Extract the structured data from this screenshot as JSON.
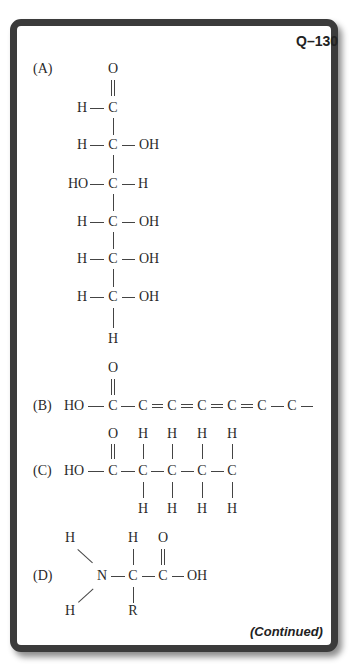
{
  "header": {
    "question_id": "Q–130"
  },
  "footer": {
    "continued_label": "(Continued)"
  },
  "options": [
    {
      "label": "(A)",
      "description": "Fischer projection of an aldohexose (glucose)",
      "atoms": {
        "o_top": "O",
        "r1": [
          "H",
          "C",
          ""
        ],
        "r2": [
          "H",
          "C",
          "OH"
        ],
        "r3": [
          "HO",
          "C",
          "H"
        ],
        "r4": [
          "H",
          "C",
          "OH"
        ],
        "r5": [
          "H",
          "C",
          "OH"
        ],
        "r6": [
          "H",
          "C",
          "OH"
        ],
        "h_bottom": "H"
      }
    },
    {
      "label": "(B)",
      "description": "HO–C(=O)–C=C=C=C=C–C–",
      "atoms": {
        "o_top": "O",
        "left": "HO",
        "carbons": [
          "C",
          "C",
          "C",
          "C",
          "C",
          "C",
          "C"
        ]
      }
    },
    {
      "label": "(C)",
      "description": "Pentanoic acid chain HO–C(=O)–CH2–CH2–CH2–CH3",
      "atoms": {
        "o_top": "O",
        "left": "HO",
        "carbons": [
          "C",
          "C",
          "C",
          "C",
          "C"
        ],
        "h": "H"
      }
    },
    {
      "label": "(D)",
      "description": "Generic amino acid H2N–CH(R)–COOH",
      "atoms": {
        "h1": "H",
        "h2": "H",
        "n": "N",
        "c_alpha": "C",
        "h_alpha": "H",
        "r": "R",
        "c_carboxyl": "C",
        "o": "O",
        "oh": "OH"
      }
    }
  ]
}
